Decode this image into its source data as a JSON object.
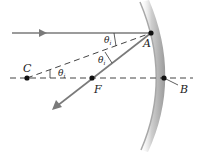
{
  "diagram": {
    "points": {
      "A": {
        "label": "A",
        "x": 151,
        "y": 33
      },
      "B": {
        "label": "B",
        "x": 164,
        "y": 78
      },
      "C": {
        "label": "C",
        "x": 27,
        "y": 78
      },
      "F": {
        "label": "F",
        "x": 92,
        "y": 78
      }
    },
    "angles": [
      {
        "label": "θ",
        "subscript": "i",
        "where": "between incident ray and radius CA at A"
      },
      {
        "label": "θ",
        "subscript": "i",
        "where": "between radius CA and reflected ray at A"
      },
      {
        "label": "θ",
        "subscript": "i",
        "where": "between axis and radius CA at C"
      }
    ],
    "rays": {
      "incident": "horizontal ray traveling right toward mirror at A",
      "reflected": "ray from A passing through F, traveling down-left",
      "radius": "dashed line from C to A (normal)",
      "axis": "dashed principal axis through C, F, B"
    },
    "colors": {
      "ray": "#7a7a7a",
      "mirror": "#bdbdbd",
      "dashed": "#555555",
      "point": "#111111"
    }
  }
}
